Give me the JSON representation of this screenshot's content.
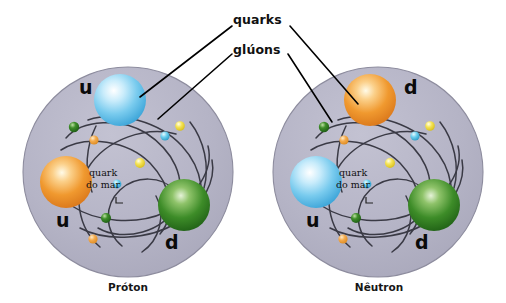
{
  "figure": {
    "title_labels": {
      "quarks": "quarks",
      "gluons": "glúons"
    },
    "colors": {
      "nucleon_fill": "#b3b2c4",
      "nucleon_edge": "#8d8c9e",
      "gluon_line": "#3a3a45",
      "quark_up_blue": "#5bbdea",
      "quark_orange": "#ef8d2a",
      "quark_green": "#2f7d21",
      "sea_yellow": "#f2dd3a",
      "sea_cyan": "#56c4e8",
      "sea_small_green": "#2f7d21",
      "sea_small_orange": "#f0a542",
      "leader_line": "#000000",
      "text": "#111111",
      "background": "#ffffff"
    },
    "particles": [
      {
        "id": "proton",
        "caption": "Próton",
        "quarks": [
          {
            "label": "u",
            "color_name": "blue",
            "position": "top"
          },
          {
            "label": "u",
            "color_name": "orange",
            "position": "left"
          },
          {
            "label": "d",
            "color_name": "green",
            "position": "right"
          }
        ],
        "sea_quark_label_line1": "quark",
        "sea_quark_label_line2": "do mar"
      },
      {
        "id": "neutron",
        "caption": "Nêutron",
        "quarks": [
          {
            "label": "d",
            "color_name": "orange",
            "position": "top"
          },
          {
            "label": "u",
            "color_name": "blue",
            "position": "left"
          },
          {
            "label": "d",
            "color_name": "green",
            "position": "right"
          }
        ],
        "sea_quark_label_line1": "quark",
        "sea_quark_label_line2": "do mar"
      }
    ]
  }
}
